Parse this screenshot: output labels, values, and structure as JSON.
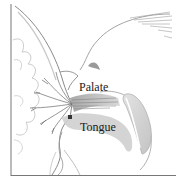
{
  "figure": {
    "labels": {
      "palate": "Palate",
      "tongue": "Tongue"
    },
    "colors": {
      "line": "#6e6e6e",
      "shade": "#bdbdbd",
      "dark_shade": "#8a8a8a",
      "text": "#1a1a1a",
      "background": "#ffffff"
    }
  }
}
